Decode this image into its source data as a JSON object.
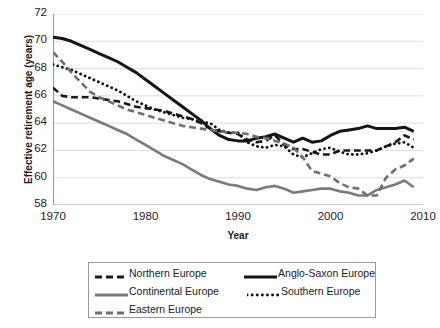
{
  "chart_data": {
    "type": "line",
    "title": "",
    "xlabel": "Year",
    "ylabel": "Effective retirement age (years)",
    "xlim": [
      1970,
      2010
    ],
    "ylim": [
      58,
      72
    ],
    "ytick_values": [
      58,
      60,
      62,
      64,
      66,
      68,
      70,
      72
    ],
    "ytick_labels": [
      "58",
      "60",
      "62",
      "64",
      "66",
      "68",
      "70",
      "72"
    ],
    "xtick_values": [
      1970,
      1980,
      1990,
      2000,
      2010
    ],
    "xtick_labels": [
      "1970",
      "1980",
      "1990",
      "2000",
      "2010"
    ],
    "grid": "horizontal",
    "legend_position": "below",
    "x": [
      1970,
      1971,
      1972,
      1973,
      1974,
      1975,
      1976,
      1977,
      1978,
      1979,
      1980,
      1981,
      1982,
      1983,
      1984,
      1985,
      1986,
      1987,
      1988,
      1989,
      1990,
      1991,
      1992,
      1993,
      1994,
      1995,
      1996,
      1997,
      1998,
      1999,
      2000,
      2001,
      2002,
      2003,
      2004,
      2005,
      2006,
      2007,
      2008,
      2009
    ],
    "series": [
      {
        "name": "Northern Europe",
        "style": "dashed",
        "color": "#1a1a1a",
        "width": 2.6,
        "values": [
          66.6,
          66.0,
          65.9,
          65.9,
          65.9,
          65.8,
          65.7,
          65.6,
          65.4,
          65.2,
          65.1,
          65.0,
          64.9,
          64.7,
          64.5,
          64.3,
          64.0,
          63.6,
          63.4,
          63.3,
          63.2,
          62.8,
          62.6,
          62.7,
          63.1,
          62.4,
          62.1,
          62.1,
          61.9,
          61.7,
          61.7,
          62.0,
          62.0,
          62.0,
          62.0,
          62.0,
          62.3,
          62.6,
          63.1,
          62.8
        ]
      },
      {
        "name": "Anglo-Saxon Europe",
        "style": "solid",
        "color": "#141414",
        "width": 3.0,
        "values": [
          70.3,
          70.2,
          70.0,
          69.7,
          69.4,
          69.1,
          68.8,
          68.5,
          68.1,
          67.7,
          67.2,
          66.7,
          66.2,
          65.7,
          65.2,
          64.7,
          64.2,
          63.6,
          63.1,
          62.8,
          62.7,
          62.7,
          62.9,
          63.0,
          63.2,
          62.9,
          62.6,
          62.9,
          62.6,
          62.7,
          63.1,
          63.4,
          63.5,
          63.6,
          63.8,
          63.6,
          63.6,
          63.6,
          63.7,
          63.4
        ]
      },
      {
        "name": "Continental Europe",
        "style": "solid",
        "color": "#7a7a7a",
        "width": 2.6,
        "values": [
          65.6,
          65.3,
          65.0,
          64.7,
          64.4,
          64.1,
          63.8,
          63.5,
          63.2,
          62.8,
          62.4,
          62.0,
          61.6,
          61.3,
          61.0,
          60.6,
          60.2,
          59.9,
          59.7,
          59.5,
          59.4,
          59.2,
          59.1,
          59.3,
          59.4,
          59.2,
          58.9,
          59.0,
          59.1,
          59.2,
          59.2,
          59.0,
          58.9,
          58.7,
          58.7,
          59.1,
          59.3,
          59.5,
          59.8,
          59.3
        ]
      },
      {
        "name": "Southern Europe",
        "style": "dotted",
        "color": "#111111",
        "width": 2.8,
        "values": [
          68.3,
          68.1,
          67.9,
          67.6,
          67.3,
          67.0,
          66.7,
          66.4,
          66.0,
          65.6,
          65.3,
          65.0,
          64.8,
          64.6,
          64.4,
          64.3,
          64.1,
          64.0,
          63.5,
          63.3,
          63.3,
          62.6,
          62.3,
          62.2,
          62.4,
          62.3,
          61.7,
          61.5,
          61.8,
          62.1,
          62.2,
          61.9,
          61.7,
          61.7,
          61.8,
          62.0,
          62.3,
          62.5,
          62.6,
          62.2
        ]
      },
      {
        "name": "Eastern Europe",
        "style": "dashed",
        "color": "#6f6f6f",
        "width": 2.6,
        "values": [
          69.2,
          68.5,
          67.7,
          67.0,
          66.3,
          65.9,
          65.6,
          65.3,
          65.0,
          64.8,
          64.6,
          64.4,
          64.2,
          64.0,
          63.8,
          63.7,
          63.6,
          63.5,
          63.4,
          63.3,
          63.3,
          63.2,
          63.0,
          62.9,
          62.7,
          62.5,
          62.2,
          61.5,
          60.5,
          60.3,
          60.1,
          59.6,
          59.3,
          59.2,
          58.7,
          58.7,
          60.0,
          60.6,
          60.9,
          61.4
        ]
      }
    ]
  },
  "legend": {
    "items": [
      {
        "label": "Northern Europe",
        "style": "dashed",
        "color": "#1a1a1a"
      },
      {
        "label": "Anglo-Saxon Europe",
        "style": "solid",
        "color": "#141414"
      },
      {
        "label": "Continental Europe",
        "style": "solid",
        "color": "#7a7a7a"
      },
      {
        "label": "Southern Europe",
        "style": "dotted",
        "color": "#111111"
      },
      {
        "label": "Eastern Europe",
        "style": "dashed",
        "color": "#6f6f6f"
      }
    ]
  }
}
